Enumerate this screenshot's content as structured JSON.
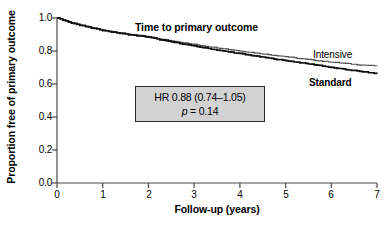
{
  "chart_data": {
    "type": "line",
    "title": "Time to primary outcome",
    "xlabel": "Follow-up (years)",
    "ylabel": "Proportion free of primary outcome",
    "xlim": [
      0,
      7
    ],
    "ylim": [
      0.0,
      1.0
    ],
    "xticks": [
      "0",
      "1",
      "2",
      "3",
      "4",
      "5",
      "6",
      "7"
    ],
    "yticks": [
      "0.0",
      "0.2",
      "0.4",
      "0.6",
      "0.8",
      "1.0"
    ],
    "grid": false,
    "legend_position": "inline-right-of-curves",
    "series": [
      {
        "name": "Intensive",
        "color": "#4d4d4d",
        "x": [
          0,
          0.25,
          0.5,
          0.75,
          1.0,
          1.25,
          1.5,
          1.75,
          2.0,
          2.25,
          2.5,
          2.75,
          3.0,
          3.25,
          3.5,
          3.75,
          4.0,
          4.25,
          4.5,
          4.75,
          5.0,
          5.25,
          5.5,
          5.75,
          6.0,
          6.25,
          6.5,
          6.75,
          7.0
        ],
        "values": [
          1.0,
          0.977,
          0.958,
          0.942,
          0.928,
          0.916,
          0.905,
          0.896,
          0.886,
          0.873,
          0.862,
          0.851,
          0.84,
          0.829,
          0.82,
          0.81,
          0.8,
          0.791,
          0.782,
          0.774,
          0.766,
          0.756,
          0.748,
          0.74,
          0.733,
          0.726,
          0.719,
          0.714,
          0.71
        ]
      },
      {
        "name": "Standard",
        "color": "#0f0f0f",
        "x": [
          0,
          0.25,
          0.5,
          0.75,
          1.0,
          1.25,
          1.5,
          1.75,
          2.0,
          2.25,
          2.5,
          2.75,
          3.0,
          3.25,
          3.5,
          3.75,
          4.0,
          4.25,
          4.5,
          4.75,
          5.0,
          5.25,
          5.5,
          5.75,
          6.0,
          6.25,
          6.5,
          6.75,
          7.0
        ],
        "values": [
          1.0,
          0.976,
          0.956,
          0.94,
          0.925,
          0.913,
          0.902,
          0.893,
          0.884,
          0.869,
          0.855,
          0.843,
          0.83,
          0.818,
          0.806,
          0.795,
          0.784,
          0.773,
          0.762,
          0.752,
          0.742,
          0.732,
          0.722,
          0.712,
          0.7,
          0.69,
          0.681,
          0.672,
          0.662
        ]
      }
    ],
    "annotation": {
      "hazard_ratio_text": "HR 0.88 (0.74–1.05)",
      "p_symbol": "p",
      "p_value_text": " = 0.14",
      "box_fill": "#d2d2d2",
      "box_border": "#2a2a2a"
    }
  },
  "labels": {
    "intensive": "Intensive",
    "standard": "Standard"
  }
}
